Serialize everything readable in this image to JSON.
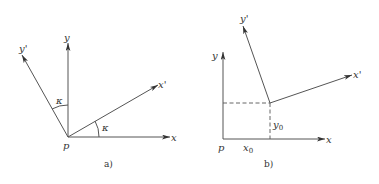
{
  "figure": {
    "panel_a": {
      "caption": "a)",
      "origin_label": "p",
      "axis_x_label": "x",
      "axis_y_label": "y",
      "axis_x_prime_label": "x'",
      "axis_y_prime_label": "y'",
      "angle_label_1": "κ",
      "angle_label_2": "κ"
    },
    "panel_b": {
      "caption": "b)",
      "origin_label": "p",
      "axis_x_label": "x",
      "axis_y_label": "y",
      "axis_x_prime_label": "x'",
      "axis_y_prime_label": "y'",
      "x0_label": "x",
      "x0_sub": "0",
      "y0_label": "y",
      "y0_sub": "0"
    }
  }
}
